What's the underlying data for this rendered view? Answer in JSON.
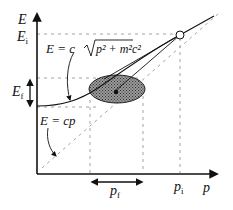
{
  "diagram": {
    "axes": {
      "y_label": "E",
      "x_label": "p"
    },
    "labels": {
      "E_initial": "E",
      "E_initial_sub": "i",
      "E_final": "E",
      "E_final_sub": "f",
      "p_initial": "p",
      "p_initial_sub": "i",
      "p_final": "p",
      "p_final_sub": "f",
      "curve_formula_lhs": "E = c",
      "curve_formula_rad": "p² + m²c²",
      "line_formula": "E = cp"
    },
    "elements": [
      "dispersion-curve",
      "light-line-asymptote",
      "initial-state-point",
      "final-state-ellipse",
      "tangent-lines",
      "energy-uncertainty-arrow",
      "momentum-uncertainty-arrow"
    ],
    "colors": {
      "ink": "#111111",
      "ellipse_fill": "#7a7a7a",
      "dashed": "#888888"
    }
  }
}
